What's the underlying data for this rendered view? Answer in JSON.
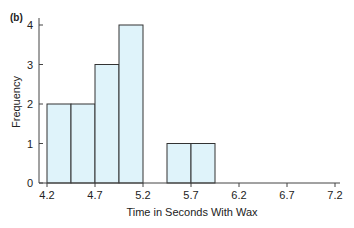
{
  "chart_data": {
    "type": "bar",
    "panel_label": "(b)",
    "title": "",
    "xlabel": "Time in Seconds With Wax",
    "ylabel": "Frequency",
    "bins": [
      {
        "start": 4.2,
        "end": 4.45,
        "count": 2
      },
      {
        "start": 4.45,
        "end": 4.7,
        "count": 2
      },
      {
        "start": 4.7,
        "end": 4.95,
        "count": 3
      },
      {
        "start": 4.95,
        "end": 5.2,
        "count": 4
      },
      {
        "start": 5.2,
        "end": 5.45,
        "count": 0
      },
      {
        "start": 5.45,
        "end": 5.7,
        "count": 1
      },
      {
        "start": 5.7,
        "end": 5.95,
        "count": 1
      },
      {
        "start": 5.95,
        "end": 6.2,
        "count": 0
      }
    ],
    "categories": [
      "4.2-4.45",
      "4.45-4.7",
      "4.7-4.95",
      "4.95-5.2",
      "5.2-5.45",
      "5.45-5.7",
      "5.7-5.95",
      "5.95-6.2"
    ],
    "values": [
      2,
      2,
      3,
      4,
      0,
      1,
      1,
      0
    ],
    "x_ticks": [
      "4.2",
      "4.7",
      "5.2",
      "5.7",
      "6.2",
      "6.7",
      "7.2"
    ],
    "y_ticks": [
      "0",
      "1",
      "2",
      "3",
      "4"
    ],
    "xlim": [
      4.2,
      7.2
    ],
    "ylim": [
      0,
      4
    ],
    "grid": false,
    "legend": null,
    "bar_fill": "#dff3fa",
    "bar_stroke": "#333333"
  }
}
